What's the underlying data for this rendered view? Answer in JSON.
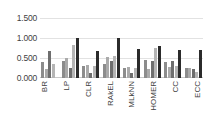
{
  "chart_data": {
    "type": "bar",
    "title": "",
    "xlabel": "",
    "ylabel": "",
    "ylim": [
      0.0,
      1.5
    ],
    "grid": true,
    "legend": "none",
    "ytick_labels": [
      "1.500",
      "1.000",
      "0.500",
      "0.000"
    ],
    "ytick_values": [
      1.5,
      1.0,
      0.5,
      0.0
    ],
    "categories": [
      "BR",
      "LP",
      "CLR",
      "RAkEL",
      "MLkNN",
      "HOMER",
      "CC",
      "ECC"
    ],
    "series": [
      {
        "name": "series-1",
        "color": "#8c8c8c",
        "values": [
          0.4,
          0.43,
          0.31,
          0.35,
          0.26,
          0.44,
          0.4,
          0.26
        ]
      },
      {
        "name": "series-2",
        "color": "#aaaaaa",
        "values": [
          0.22,
          0.49,
          0.33,
          0.52,
          0.28,
          0.22,
          0.27,
          0.25
        ]
      },
      {
        "name": "series-3",
        "color": "#6e6e6e",
        "values": [
          0.68,
          0.24,
          0.13,
          0.42,
          0.12,
          0.42,
          0.42,
          0.23
        ]
      },
      {
        "name": "series-4",
        "color": "#b5b5b5",
        "values": [
          0.35,
          0.82,
          0.31,
          0.55,
          0.24,
          0.76,
          0.3,
          0.15
        ]
      },
      {
        "name": "series-5",
        "color": "#2b2b2b",
        "values": [
          0.0,
          1.0,
          0.67,
          1.0,
          0.73,
          0.79,
          0.71,
          0.69
        ]
      }
    ]
  }
}
